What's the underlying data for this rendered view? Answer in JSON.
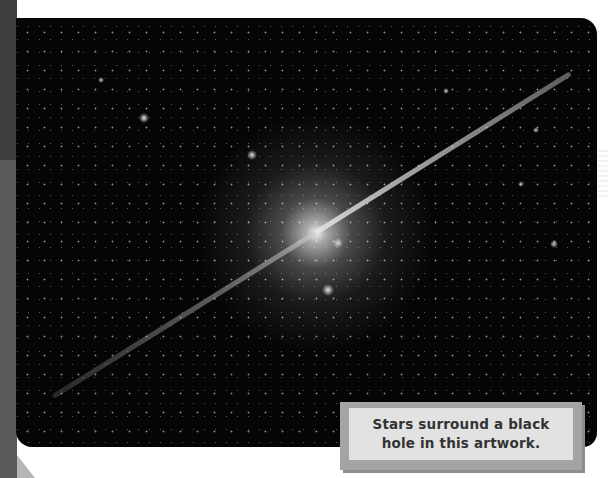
{
  "page": {
    "photo": {
      "subject": "spiral galaxy with black hole jets in starfield",
      "alt": "Artwork of stars surrounding a black hole"
    },
    "caption": {
      "line1": "Stars surround a black",
      "line2": "hole in this artwork."
    },
    "colors": {
      "background": "#ffffff",
      "left_band": "#5a5a5a",
      "caption_frame": "#a4a4a4",
      "caption_fill": "#e2e2e2",
      "caption_text": "#333333",
      "space": "#050505"
    }
  }
}
